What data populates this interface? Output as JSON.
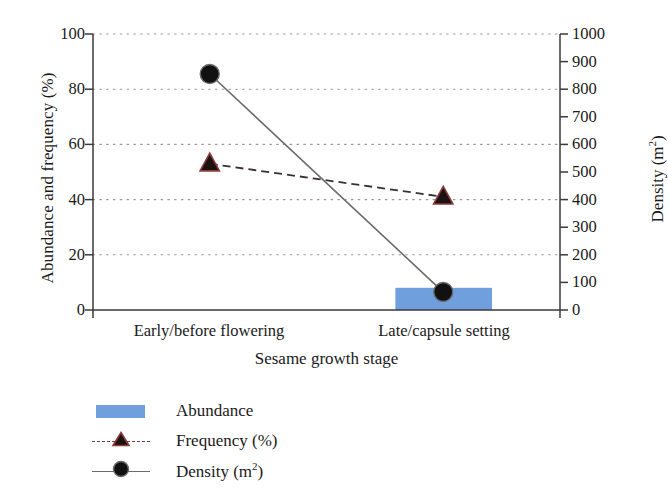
{
  "chart_data": {
    "type": "bar",
    "title": "",
    "subtitle": "",
    "xlabel": "Sesame growth stage",
    "ylabel": "Abundance and frequency (%)",
    "y2label": "Density (m2)",
    "categories": [
      "Early/before flowering",
      "Late/capsule setting"
    ],
    "ylim": [
      0,
      100
    ],
    "y2lim": [
      0,
      1000
    ],
    "yticks": [
      0,
      20,
      40,
      60,
      80,
      100
    ],
    "y2ticks": [
      0,
      100,
      200,
      300,
      400,
      500,
      600,
      700,
      800,
      900,
      1000
    ],
    "grid": true,
    "grid_style": "dotted",
    "legend_position": "below-left",
    "series": [
      {
        "name": "Abundance",
        "type": "bar",
        "axis": "left",
        "color": "#6f9fdc",
        "values": [
          82,
          8
        ]
      },
      {
        "name": "Frequency (%)",
        "type": "line",
        "axis": "left",
        "color": "#7a3a3a",
        "line_style": "dashed",
        "marker": "triangle",
        "values": [
          53,
          41
        ]
      },
      {
        "name": "Density (m2)",
        "type": "line",
        "axis": "right",
        "color": "#6b6b6b",
        "line_style": "solid",
        "marker": "circle",
        "values": [
          855,
          65
        ]
      }
    ]
  },
  "axis": {
    "y_left_title": "Abundance and frequency (%)",
    "y_right_title_main": "Density (m",
    "y_right_title_sup": "2",
    "y_right_title_close": ")",
    "x_title": "Sesame growth stage",
    "y_left_ticks": [
      "100",
      "80",
      "60",
      "40",
      "20",
      "0"
    ],
    "y_right_ticks": [
      "1000",
      "900",
      "800",
      "700",
      "600",
      "500",
      "400",
      "300",
      "200",
      "100",
      "0"
    ],
    "category_labels": [
      "Early/before flowering",
      "Late/capsule setting"
    ]
  },
  "legend": {
    "items": [
      {
        "label": "Abundance",
        "key": "swatch",
        "color": "#6f9fdc"
      },
      {
        "label": "Frequency (%)",
        "key": "dashed-triangle",
        "color": "#7a3a3a"
      },
      {
        "label_main": "Density (m",
        "label_sup": "2",
        "label_close": ")",
        "key": "solid-circle",
        "color": "#6b6b6b"
      }
    ]
  },
  "colors": {
    "bar": "#6f9fdc",
    "frequency": "#7a3a3a",
    "density": "#6b6b6b",
    "axis": "#3a3a3a",
    "grid": "#9a9a9a",
    "text": "#1a1a1a"
  }
}
